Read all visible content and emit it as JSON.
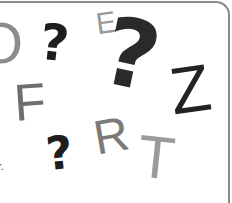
{
  "illustration": {
    "glyphs": [
      {
        "id": "o-partial",
        "char": "O",
        "color": "#8c8c8c"
      },
      {
        "id": "question-1",
        "char": "?",
        "color": "#1e1e1e"
      },
      {
        "id": "e-small",
        "char": "E",
        "color": "#9a9a9a"
      },
      {
        "id": "question-big",
        "char": "?",
        "color": "#2a2a2a"
      },
      {
        "id": "f",
        "char": "F",
        "color": "#6e6e6e"
      },
      {
        "id": "z",
        "char": "Z",
        "color": "#232323"
      },
      {
        "id": "question-2",
        "char": "?",
        "color": "#1e1e1e"
      },
      {
        "id": "r",
        "char": "R",
        "color": "#7a7a7a"
      },
      {
        "id": "t",
        "char": "T",
        "color": "#9a9a9a"
      }
    ],
    "caption_fragment": "r."
  }
}
